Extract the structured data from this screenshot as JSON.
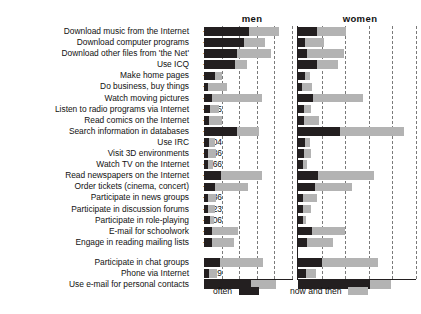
{
  "panels": {
    "men": "men",
    "women": "women"
  },
  "legend": {
    "often": "often",
    "now_and_then": "now and then"
  },
  "colors": {
    "often": "#231f20",
    "now_and_then": "#b3b3b3",
    "gridline": "#7a7a7a",
    "axis": "#231f20",
    "background": "#ffffff",
    "text": "#111111"
  },
  "chart_data": {
    "type": "bar",
    "orientation": "horizontal",
    "stacked": true,
    "title": "",
    "subtitle": "",
    "xlabel": "",
    "ylabel": "",
    "grid": true,
    "legend_position": "bottom-left",
    "panels": [
      "men",
      "women"
    ],
    "series": [
      {
        "name": "often",
        "color": "#231f20"
      },
      {
        "name": "now and then",
        "color": "#b3b3b3"
      }
    ],
    "value_column_header": "",
    "xlim": [
      0,
      100
    ],
    "gridline_values": [
      20,
      40,
      60,
      80,
      100
    ],
    "groups": [
      {
        "start": 0,
        "end": 18
      },
      {
        "start": 19,
        "end": 20
      }
    ],
    "categories": [
      "Download music from the Internet",
      "Download computer programs",
      "Download other files from 'the Net'",
      "Use ICQ",
      "Make home pages",
      "Do business, buy things",
      "Watch moving pictures",
      "Listen to radio programs via Internet",
      "Read comics on the Internet",
      "Search information in databases",
      "Use IRC",
      "Visit 3D environments",
      "Watch TV on the Internet",
      "Read newspapers on the Internet",
      "Order tickets (cinema, concert)",
      "Participate in news groups",
      "Participate in discussion forums",
      "Participate in role-playing",
      "E-mail for schoolwork",
      "Engage in reading mailing lists",
      "Participate in chat groups",
      "Phone via Internet",
      "Use e-mail for personal contacts"
    ],
    "correlations": [
      "-.597",
      "-.578",
      "-.568",
      "-.404",
      "-.306",
      "-.249",
      "-.227",
      "-.225",
      "-.217",
      "-.210",
      "-.204",
      "-.186",
      "-.166",
      "-.165",
      "-.163",
      "-.136",
      "-.123",
      "-.106",
      "-.100",
      "-.079",
      ".038",
      ".029",
      ".000"
    ],
    "rows": [
      {
        "label": "Download music from the Internet",
        "value": "-.597",
        "men": {
          "often": 51,
          "now_and_then": 34
        },
        "women": {
          "often": 16,
          "now_and_then": 25
        },
        "gap_before": false
      },
      {
        "label": "Download computer programs",
        "value": "-.578",
        "men": {
          "often": 45,
          "now_and_then": 24
        },
        "women": {
          "often": 6,
          "now_and_then": 16
        },
        "gap_before": false
      },
      {
        "label": "Download other files from 'the Net'",
        "value": "-.568",
        "men": {
          "often": 38,
          "now_and_then": 38
        },
        "women": {
          "often": 8,
          "now_and_then": 31
        },
        "gap_before": false
      },
      {
        "label": "Use ICQ",
        "value": "-.404",
        "men": {
          "often": 35,
          "now_and_then": 14
        },
        "women": {
          "often": 16,
          "now_and_then": 18
        },
        "gap_before": false
      },
      {
        "label": "Make home pages",
        "value": "-.306",
        "men": {
          "often": 12,
          "now_and_then": 9
        },
        "women": {
          "often": 6,
          "now_and_then": 4
        },
        "gap_before": false
      },
      {
        "label": "Do business, buy things",
        "value": "-.249",
        "men": {
          "often": 5,
          "now_and_then": 21
        },
        "women": {
          "often": 3,
          "now_and_then": 9
        },
        "gap_before": false
      },
      {
        "label": "Watch moving pictures",
        "value": "-.227",
        "men": {
          "often": 9,
          "now_and_then": 57
        },
        "women": {
          "often": 13,
          "now_and_then": 42
        },
        "gap_before": false
      },
      {
        "label": "Listen to radio programs via Internet",
        "value": "-.225",
        "men": {
          "often": 7,
          "now_and_then": 10
        },
        "women": {
          "often": 5,
          "now_and_then": 6
        },
        "gap_before": false
      },
      {
        "label": "Read comics on the Internet",
        "value": "-.217",
        "men": {
          "often": 6,
          "now_and_then": 14
        },
        "women": {
          "often": 5,
          "now_and_then": 13
        },
        "gap_before": false
      },
      {
        "label": "Search information in databases",
        "value": "-.210",
        "men": {
          "often": 38,
          "now_and_then": 25
        },
        "women": {
          "often": 36,
          "now_and_then": 54
        },
        "gap_before": false
      },
      {
        "label": "Use IRC",
        "value": "-.204",
        "men": {
          "often": 6,
          "now_and_then": 7
        },
        "women": {
          "often": 6,
          "now_and_then": 4
        },
        "gap_before": false
      },
      {
        "label": "Visit 3D environments",
        "value": "-.186",
        "men": {
          "often": 5,
          "now_and_then": 9
        },
        "women": {
          "often": 5,
          "now_and_then": 6
        },
        "gap_before": false
      },
      {
        "label": "Watch TV on the Internet",
        "value": "-.166",
        "men": {
          "often": 5,
          "now_and_then": 5
        },
        "women": {
          "often": 4,
          "now_and_then": 4
        },
        "gap_before": false
      },
      {
        "label": "Read newspapers on the Internet",
        "value": "-.165",
        "men": {
          "often": 19,
          "now_and_then": 47
        },
        "women": {
          "often": 17,
          "now_and_then": 47
        },
        "gap_before": false
      },
      {
        "label": "Order tickets (cinema, concert)",
        "value": "-.163",
        "men": {
          "often": 13,
          "now_and_then": 37
        },
        "women": {
          "often": 14,
          "now_and_then": 32
        },
        "gap_before": false
      },
      {
        "label": "Participate in news groups",
        "value": "-.136",
        "men": {
          "often": 5,
          "now_and_then": 9
        },
        "women": {
          "often": 4,
          "now_and_then": 12
        },
        "gap_before": false
      },
      {
        "label": "Participate in discussion forums",
        "value": "-.123",
        "men": {
          "often": 5,
          "now_and_then": 7
        },
        "women": {
          "often": 4,
          "now_and_then": 7
        },
        "gap_before": false
      },
      {
        "label": "Participate in role-playing",
        "value": "-.106",
        "men": {
          "often": 7,
          "now_and_then": 4
        },
        "women": {
          "often": 4,
          "now_and_then": 3
        },
        "gap_before": false
      },
      {
        "label": "E-mail for schoolwork",
        "value": "-.100",
        "men": {
          "often": 9,
          "now_and_then": 30
        },
        "women": {
          "often": 12,
          "now_and_then": 28
        },
        "gap_before": false
      },
      {
        "label": "Engage in reading mailing lists",
        "value": "-.079",
        "men": {
          "often": 9,
          "now_and_then": 25
        },
        "women": {
          "often": 8,
          "now_and_then": 22
        },
        "gap_before": false
      },
      {
        "label": "Participate in chat groups",
        "value": ".038",
        "men": {
          "often": 18,
          "now_and_then": 49
        },
        "women": {
          "often": 20,
          "now_and_then": 48
        },
        "gap_before": true
      },
      {
        "label": "Phone via Internet",
        "value": ".029",
        "men": {
          "often": 6,
          "now_and_then": 9
        },
        "women": {
          "often": 7,
          "now_and_then": 8
        },
        "gap_before": false
      },
      {
        "label": "Use e-mail for personal contacts",
        "value": ".000",
        "men": {
          "often": 53,
          "now_and_then": 29
        },
        "women": {
          "often": 61,
          "now_and_then": 18
        },
        "gap_before": false
      }
    ]
  }
}
